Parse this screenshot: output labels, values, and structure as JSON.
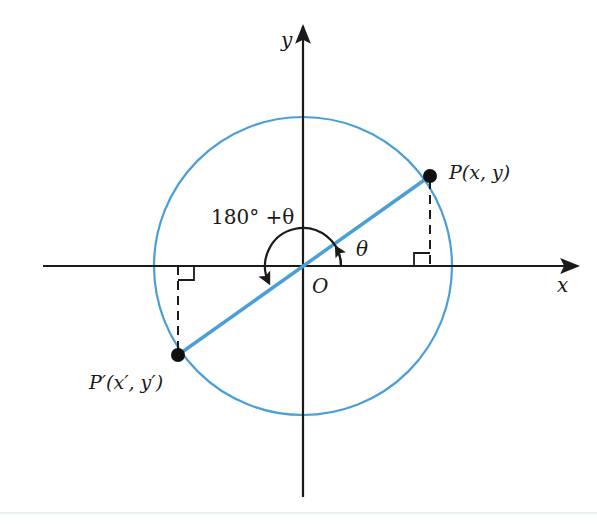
{
  "figure": {
    "type": "unit-circle-angle-diagram",
    "axes": {
      "x_label": "x",
      "y_label": "y",
      "origin_label": "O"
    },
    "points": {
      "P": {
        "label": "P(x,  y)"
      },
      "P_prime": {
        "label": "P′(x′,  y′)"
      }
    },
    "angles": {
      "theta_label": "θ",
      "supplementary_label": "180° +θ"
    },
    "colors": {
      "circle": "#4a9fd8",
      "radius_line": "#4a9fd8",
      "axes": "#1a1a1a",
      "points": "#111111",
      "dashed": "#1a1a1a"
    }
  }
}
